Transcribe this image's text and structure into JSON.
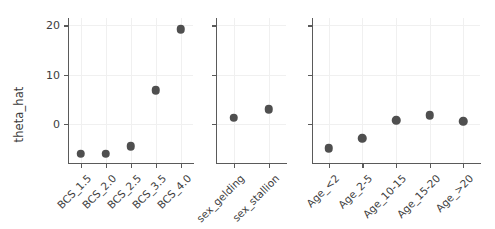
{
  "figure": {
    "ylabel": "theta_hat",
    "background": "#ffffff",
    "point_color": "#4f4f4f",
    "axis_color": "#5a5a5a",
    "grid_color": "#f0f0f0"
  },
  "chart_data": {
    "type": "scatter",
    "title": "",
    "xlabel": "",
    "ylabel": "theta_hat",
    "ylim": [
      -8,
      21.5
    ],
    "yticks": [
      0,
      10,
      20
    ],
    "ytick_labels": [
      "0",
      "10",
      "20"
    ],
    "grid": true,
    "legend": "none",
    "panels": [
      {
        "name": "BCS",
        "categories": [
          "BCS_1.5",
          "BCS_2.0",
          "BCS_2.5",
          "BCS_3.5",
          "BCS_4.0"
        ],
        "values": [
          -6.1,
          -6.1,
          -4.6,
          6.8,
          19.2
        ]
      },
      {
        "name": "sex",
        "categories": [
          "sex_gelding",
          "sex_stallion"
        ],
        "values": [
          1.2,
          2.9
        ]
      },
      {
        "name": "Age",
        "categories": [
          "Age_<2",
          "Age_2-5",
          "Age_10-15",
          "Age_15-20",
          "Age_>20"
        ],
        "values": [
          -5.0,
          -3.0,
          0.7,
          1.7,
          0.5
        ]
      }
    ]
  }
}
